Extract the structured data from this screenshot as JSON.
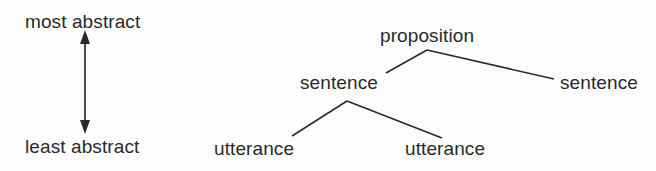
{
  "scale": {
    "top_label": "most abstract",
    "bottom_label": "least abstract",
    "arrow": "double-headed-vertical-arrow"
  },
  "tree": {
    "root": "proposition",
    "level2_left": "sentence",
    "level2_right": "sentence",
    "level3_left": "utterance",
    "level3_right": "utterance"
  },
  "colors": {
    "ink": "#2a2a2a",
    "background": "#fdfdfd"
  }
}
